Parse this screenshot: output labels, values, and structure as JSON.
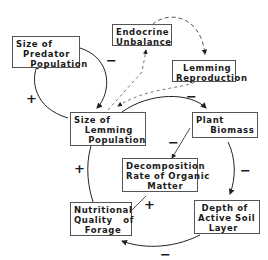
{
  "nodes": {
    "predator": {
      "label": "Size of\n  Predator\n    Population"
    },
    "endocrine": {
      "label": "Endocrine\nUnbalance"
    },
    "reproduction": {
      "label": "  Lemming\nReproduction"
    },
    "lemming": {
      "label": "Size of\n   Lemming\n    Population"
    },
    "plant": {
      "label": "Plant\n    Biomass"
    },
    "decomposition": {
      "label": "Decomposition\nRate of Organic\n      Matter"
    },
    "nutrition": {
      "label": "Nutritional\nQuality   of\n   Forage"
    },
    "soil": {
      "label": " Depth of\nActive Soil\n   Layer"
    }
  },
  "signs": {
    "predator_to_lemming": "−",
    "lemming_to_predator": "+",
    "lemming_to_plant": "−",
    "plant_to_decomposition": "−",
    "plant_to_soil": "−",
    "soil_to_nutrition": "−",
    "decomposition_to_nutrition": "+",
    "nutrition_to_lemming": "+"
  }
}
